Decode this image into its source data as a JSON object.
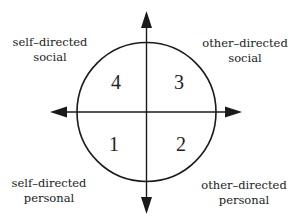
{
  "diagram": {
    "type": "quadrant-circle",
    "axes": {
      "vertical": "double-headed arrow",
      "horizontal": "double-headed arrow"
    },
    "quadrants": [
      {
        "number": "4",
        "position": "top-left",
        "label_line1": "self–directed",
        "label_line2": "social"
      },
      {
        "number": "3",
        "position": "top-right",
        "label_line1": "other–directed",
        "label_line2": "social"
      },
      {
        "number": "1",
        "position": "bottom-left",
        "label_line1": "self–directed",
        "label_line2": "personal"
      },
      {
        "number": "2",
        "position": "bottom-right",
        "label_line1": "other–directed",
        "label_line2": "personal"
      }
    ],
    "colors": {
      "stroke": "#1a1a1a",
      "background": "#ffffff",
      "text": "#222222"
    }
  }
}
